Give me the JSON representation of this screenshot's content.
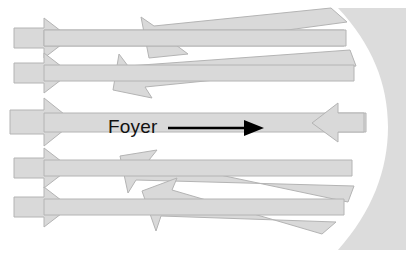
{
  "figure": {
    "type": "optics-ray-diagram",
    "background_color": "#ffffff",
    "ray_fill_color": "#d9d9d9",
    "ray_stroke_color": "#b4b4b4",
    "mirror_color": "#dcdcdc",
    "pointer_color": "#000000",
    "width": 406,
    "height": 253
  },
  "annotation": {
    "label": "Foyer",
    "label_x": 108,
    "label_y": 133,
    "pointer_from_x": 168,
    "pointer_from_y": 128,
    "pointer_to_x": 258,
    "pointer_to_y": 128
  },
  "focus": {
    "name": "focal-point",
    "x": 262,
    "y": 127
  },
  "mirror": {
    "name": "concave-mirror",
    "outer_right_x": 406,
    "top_y": 10,
    "bottom_y": 248,
    "vertex_x": 366,
    "description": "curved reflective surface at right"
  },
  "incoming_rays": [
    {
      "name": "incoming-ray-1",
      "y": 38,
      "x_start": 14,
      "x_end": 340,
      "head_x": 62,
      "direction": "right"
    },
    {
      "name": "incoming-ray-2",
      "y": 73,
      "x_start": 14,
      "x_end": 350,
      "head_x": 62,
      "direction": "right"
    },
    {
      "name": "incoming-ray-3",
      "y": 122,
      "x_start": 10,
      "x_end": 366,
      "head_x": 66,
      "direction": "right"
    },
    {
      "name": "incoming-ray-4",
      "y": 168,
      "x_start": 14,
      "x_end": 350,
      "head_x": 62,
      "direction": "right"
    },
    {
      "name": "incoming-ray-5",
      "y": 207,
      "x_start": 14,
      "x_end": 340,
      "head_x": 62,
      "direction": "right"
    }
  ],
  "reflected_rays": [
    {
      "name": "reflected-ray-up-steep",
      "from_x": 340,
      "from_y": 30,
      "to_x": 146,
      "to_y": 14,
      "direction": "up-left"
    },
    {
      "name": "reflected-ray-up-shallow",
      "from_x": 352,
      "from_y": 66,
      "to_x": 116,
      "to_y": 62,
      "direction": "up-left"
    },
    {
      "name": "reflected-ray-axis",
      "from_x": 366,
      "from_y": 122,
      "to_x": 300,
      "to_y": 122,
      "direction": "left"
    },
    {
      "name": "reflected-ray-down-shallow",
      "from_x": 352,
      "from_y": 176,
      "to_x": 128,
      "to_y": 182,
      "direction": "down-left"
    },
    {
      "name": "reflected-ray-down-steep",
      "from_x": 340,
      "from_y": 212,
      "to_x": 150,
      "to_y": 230,
      "direction": "down-left"
    }
  ]
}
